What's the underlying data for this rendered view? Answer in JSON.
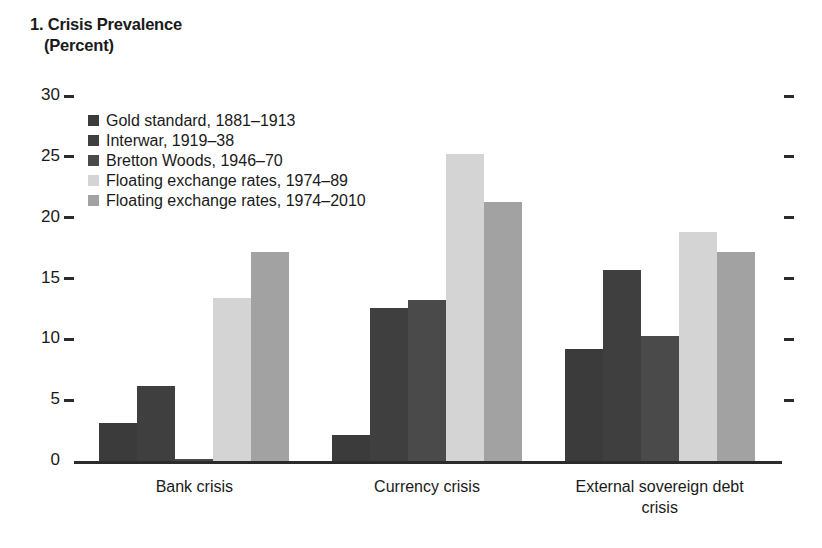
{
  "chart_data": {
    "type": "bar",
    "title": "1. Crisis Prevalence",
    "subtitle": "(Percent)",
    "xlabel": "",
    "ylabel": "",
    "ylim": [
      0,
      30
    ],
    "yticks": [
      0,
      5,
      10,
      15,
      20,
      25,
      30
    ],
    "ytick_labels": [
      "0",
      "5",
      "10",
      "15",
      "20",
      "25",
      "30"
    ],
    "grid": false,
    "legend_position": "upper-left-inside",
    "categories": [
      "Bank crisis",
      "Currency crisis",
      "External sovereign debt\ncrisis"
    ],
    "series": [
      {
        "name": "Gold standard, 1881–1913",
        "color": "#3b3b3b",
        "values": [
          3.1,
          2.1,
          9.2
        ]
      },
      {
        "name": "Interwar, 1919–38",
        "color": "#3f3f3f",
        "values": [
          6.2,
          12.6,
          15.7
        ]
      },
      {
        "name": "Bretton Woods, 1946–70",
        "color": "#4a4a4a",
        "values": [
          0.2,
          13.2,
          10.3
        ]
      },
      {
        "name": "Floating exchange rates, 1974–89",
        "color": "#d4d4d4",
        "values": [
          13.4,
          25.2,
          18.8
        ]
      },
      {
        "name": "Floating exchange rates, 1974–2010",
        "color": "#a2a2a2",
        "values": [
          17.2,
          21.3,
          17.2
        ]
      }
    ]
  },
  "colors": {
    "axis": "#2b2b2b",
    "text": "#1a1a1a",
    "background": "#ffffff"
  }
}
